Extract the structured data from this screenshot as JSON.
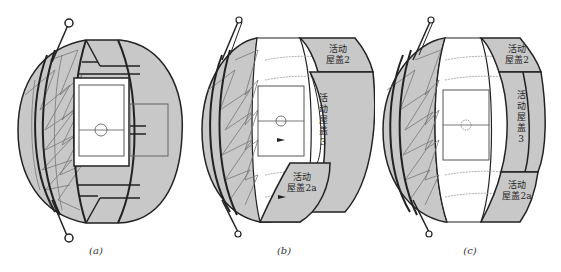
{
  "figure": {
    "panels": [
      {
        "id": "a",
        "label": "(a)",
        "state": "roof closed"
      },
      {
        "id": "b",
        "label": "(b)",
        "state": "roof partially open"
      },
      {
        "id": "c",
        "label": "(c)",
        "state": "roof open"
      }
    ],
    "roof_labels": {
      "roof2_line1": "活动",
      "roof2_line2": "屋盖2",
      "roof3_c1": "活",
      "roof3_c2": "动",
      "roof3_c3": "屋",
      "roof3_c4": "盖",
      "roof3_c5": "3",
      "roof2a_line1": "活动",
      "roof2a_line2": "屋盖2a"
    },
    "colors": {
      "roof_fill": "#c8c8c8",
      "outline": "#222222",
      "truss_line": "#666666",
      "pitch_line": "#555555",
      "background": "#ffffff"
    }
  }
}
